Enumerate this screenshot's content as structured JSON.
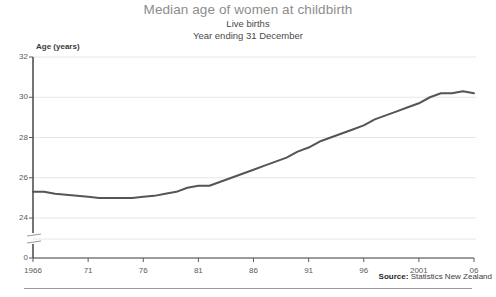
{
  "chart_data": {
    "type": "line",
    "title": "Median age of women at childbirth",
    "subtitle": "Live births",
    "subtitle2": "Year ending 31 December",
    "xlabel": "",
    "ylabel": "Age (years)",
    "ylim": [
      24,
      32
    ],
    "yticks": [
      "0",
      "24",
      "26",
      "28",
      "30",
      "32"
    ],
    "ytick_values": [
      0,
      24,
      26,
      28,
      30,
      32
    ],
    "y_axis_break": true,
    "xticks": [
      "1966",
      "71",
      "76",
      "81",
      "86",
      "91",
      "96",
      "2001",
      "06"
    ],
    "xtick_values": [
      1966,
      1971,
      1976,
      1981,
      1986,
      1991,
      1996,
      2001,
      2006
    ],
    "xlim": [
      1966,
      2006
    ],
    "grid": "horizontal",
    "legend": "none",
    "line_color": "#555555",
    "source": "Statistics New Zealand",
    "source_label": "Source:",
    "x": [
      1966,
      1967,
      1968,
      1969,
      1970,
      1971,
      1972,
      1973,
      1974,
      1975,
      1976,
      1977,
      1978,
      1979,
      1980,
      1981,
      1982,
      1983,
      1984,
      1985,
      1986,
      1987,
      1988,
      1989,
      1990,
      1991,
      1992,
      1993,
      1994,
      1995,
      1996,
      1997,
      1998,
      1999,
      2000,
      2001,
      2002,
      2003,
      2004,
      2005,
      2006
    ],
    "values": [
      25.3,
      25.3,
      25.2,
      25.15,
      25.1,
      25.05,
      25.0,
      25.0,
      25.0,
      25.0,
      25.05,
      25.1,
      25.2,
      25.3,
      25.5,
      25.6,
      25.6,
      25.8,
      26.0,
      26.2,
      26.4,
      26.6,
      26.8,
      27.0,
      27.3,
      27.5,
      27.8,
      28.0,
      28.2,
      28.4,
      28.6,
      28.9,
      29.1,
      29.3,
      29.5,
      29.7,
      30.0,
      30.2,
      30.2,
      30.3,
      30.2
    ]
  }
}
